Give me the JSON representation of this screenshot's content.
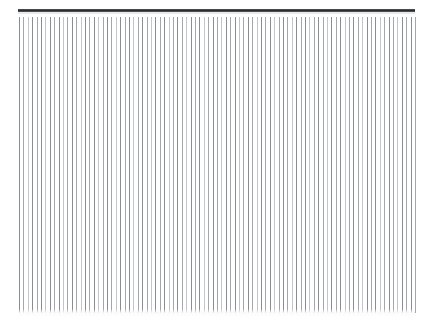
{
  "page": {
    "width": 434,
    "height": 331,
    "background_color": "#ffffff"
  },
  "top_rule": {
    "name": "horizontal-rule",
    "x": 18,
    "y": 9,
    "width": 397,
    "height": 3,
    "color": "#2f3338",
    "highlight_color": "#e9eaec"
  },
  "line_field": {
    "x": 19,
    "y": 17,
    "width": 396,
    "height": 296,
    "line_count": 90,
    "spacing": 4.4,
    "line_width": 1,
    "colors": {
      "dark": "#8a8d92",
      "medium": "#a3a6ab",
      "light": "#c2c5c9"
    },
    "lines": [
      {
        "x": 0.0,
        "tone": "dark"
      },
      {
        "x": 4.4,
        "tone": "medium"
      },
      {
        "x": 8.8,
        "tone": "light"
      },
      {
        "x": 13.2,
        "tone": "dark"
      },
      {
        "x": 17.6,
        "tone": "medium"
      },
      {
        "x": 22.0,
        "tone": "dark"
      },
      {
        "x": 26.4,
        "tone": "light"
      },
      {
        "x": 30.8,
        "tone": "dark"
      },
      {
        "x": 35.2,
        "tone": "medium"
      },
      {
        "x": 39.6,
        "tone": "dark"
      },
      {
        "x": 44.0,
        "tone": "light"
      },
      {
        "x": 48.4,
        "tone": "medium"
      },
      {
        "x": 52.8,
        "tone": "dark"
      },
      {
        "x": 57.2,
        "tone": "medium"
      },
      {
        "x": 61.6,
        "tone": "light"
      },
      {
        "x": 66.0,
        "tone": "dark"
      },
      {
        "x": 70.4,
        "tone": "medium"
      },
      {
        "x": 74.8,
        "tone": "dark"
      },
      {
        "x": 79.2,
        "tone": "light"
      },
      {
        "x": 83.6,
        "tone": "medium"
      },
      {
        "x": 88.0,
        "tone": "dark"
      },
      {
        "x": 92.4,
        "tone": "medium"
      },
      {
        "x": 96.8,
        "tone": "light"
      },
      {
        "x": 101.2,
        "tone": "dark"
      },
      {
        "x": 105.6,
        "tone": "medium"
      },
      {
        "x": 110.0,
        "tone": "dark"
      },
      {
        "x": 114.4,
        "tone": "light"
      },
      {
        "x": 118.8,
        "tone": "medium"
      },
      {
        "x": 123.2,
        "tone": "dark"
      },
      {
        "x": 127.6,
        "tone": "medium"
      },
      {
        "x": 132.0,
        "tone": "light"
      },
      {
        "x": 136.4,
        "tone": "dark"
      },
      {
        "x": 140.8,
        "tone": "medium"
      },
      {
        "x": 145.2,
        "tone": "dark"
      },
      {
        "x": 149.6,
        "tone": "light"
      },
      {
        "x": 154.0,
        "tone": "medium"
      },
      {
        "x": 158.4,
        "tone": "dark"
      },
      {
        "x": 162.8,
        "tone": "medium"
      },
      {
        "x": 167.2,
        "tone": "light"
      },
      {
        "x": 171.6,
        "tone": "dark"
      },
      {
        "x": 176.0,
        "tone": "medium"
      },
      {
        "x": 180.4,
        "tone": "dark"
      },
      {
        "x": 184.8,
        "tone": "light"
      },
      {
        "x": 189.2,
        "tone": "medium"
      },
      {
        "x": 193.6,
        "tone": "dark"
      },
      {
        "x": 198.0,
        "tone": "medium"
      },
      {
        "x": 202.4,
        "tone": "light"
      },
      {
        "x": 206.8,
        "tone": "dark"
      },
      {
        "x": 211.2,
        "tone": "medium"
      },
      {
        "x": 215.6,
        "tone": "dark"
      },
      {
        "x": 220.0,
        "tone": "light"
      },
      {
        "x": 224.4,
        "tone": "medium"
      },
      {
        "x": 228.8,
        "tone": "dark"
      },
      {
        "x": 233.2,
        "tone": "medium"
      },
      {
        "x": 237.6,
        "tone": "light"
      },
      {
        "x": 242.0,
        "tone": "dark"
      },
      {
        "x": 246.4,
        "tone": "medium"
      },
      {
        "x": 250.8,
        "tone": "dark"
      },
      {
        "x": 255.2,
        "tone": "light"
      },
      {
        "x": 259.6,
        "tone": "medium"
      },
      {
        "x": 264.0,
        "tone": "dark"
      },
      {
        "x": 268.4,
        "tone": "medium"
      },
      {
        "x": 272.8,
        "tone": "light"
      },
      {
        "x": 277.2,
        "tone": "dark"
      },
      {
        "x": 281.6,
        "tone": "medium"
      },
      {
        "x": 286.0,
        "tone": "dark"
      },
      {
        "x": 290.4,
        "tone": "light"
      },
      {
        "x": 294.8,
        "tone": "medium"
      },
      {
        "x": 299.2,
        "tone": "dark"
      },
      {
        "x": 303.6,
        "tone": "medium"
      },
      {
        "x": 308.0,
        "tone": "light"
      },
      {
        "x": 312.4,
        "tone": "dark"
      },
      {
        "x": 316.8,
        "tone": "medium"
      },
      {
        "x": 321.2,
        "tone": "dark"
      },
      {
        "x": 325.6,
        "tone": "light"
      },
      {
        "x": 330.0,
        "tone": "medium"
      },
      {
        "x": 334.4,
        "tone": "dark"
      },
      {
        "x": 338.8,
        "tone": "medium"
      },
      {
        "x": 343.2,
        "tone": "light"
      },
      {
        "x": 347.6,
        "tone": "dark"
      },
      {
        "x": 352.0,
        "tone": "medium"
      },
      {
        "x": 356.4,
        "tone": "dark"
      },
      {
        "x": 360.8,
        "tone": "light"
      },
      {
        "x": 365.2,
        "tone": "medium"
      },
      {
        "x": 369.6,
        "tone": "dark"
      },
      {
        "x": 374.0,
        "tone": "medium"
      },
      {
        "x": 378.4,
        "tone": "light"
      },
      {
        "x": 382.8,
        "tone": "dark"
      },
      {
        "x": 387.2,
        "tone": "medium"
      },
      {
        "x": 391.6,
        "tone": "dark"
      },
      {
        "x": 396.0,
        "tone": "medium"
      }
    ]
  },
  "bottom_fade": {
    "x": 19,
    "y": 309,
    "width": 396,
    "height": 8
  }
}
